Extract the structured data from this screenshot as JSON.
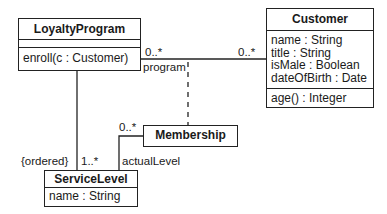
{
  "diagram": {
    "type": "UML class diagram",
    "classes": {
      "loyalty_program": {
        "name": "LoyaltyProgram",
        "attributes": [],
        "operations": [
          "enroll(c : Customer)"
        ]
      },
      "customer": {
        "name": "Customer",
        "attributes": [
          "name : String",
          "title : String",
          "isMale : Boolean",
          "dateOfBirth : Date"
        ],
        "operations": [
          "age() : Integer"
        ]
      },
      "membership": {
        "name": "Membership"
      },
      "service_level": {
        "name": "ServiceLevel",
        "attributes": [
          "name : String"
        ]
      }
    },
    "associations": {
      "program_customer": {
        "from": "LoyaltyProgram",
        "to": "Customer",
        "from_multiplicity": "0..*",
        "to_multiplicity": "0..*",
        "from_role": "program"
      },
      "program_service_level": {
        "from": "LoyaltyProgram",
        "to": "ServiceLevel",
        "constraint": "{ordered}",
        "to_multiplicity": "1..*"
      },
      "membership_service_level": {
        "from": "Membership",
        "to": "ServiceLevel",
        "from_multiplicity": "0..*",
        "to_role": "actualLevel"
      },
      "association_class": {
        "class": "Membership",
        "attached_to": "program_customer",
        "line_style": "dashed"
      }
    }
  }
}
